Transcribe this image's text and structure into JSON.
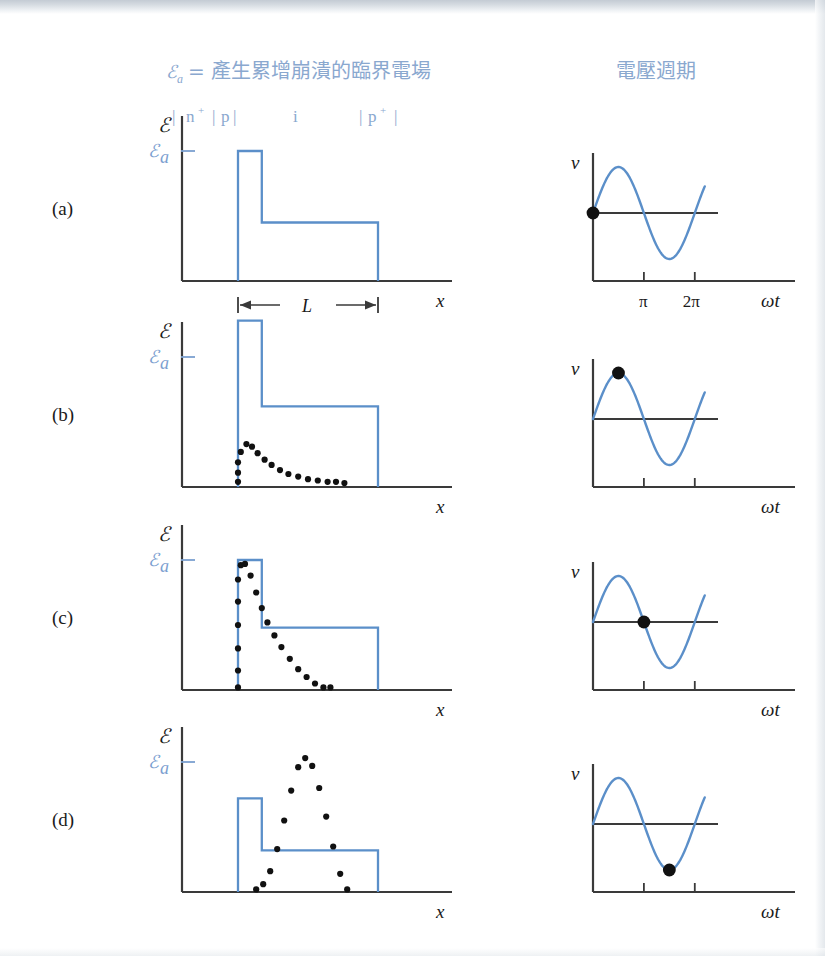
{
  "figure": {
    "headers": {
      "left_legend": "ℰa = 產生累增崩潰的臨界電場",
      "left_legend_symbol": "ℰ",
      "left_legend_sub": "a",
      "left_legend_text": "= 產生累增崩潰的臨界電場",
      "right_title": "電壓週期"
    },
    "layer_labels": [
      {
        "text": "n",
        "sup": "+"
      },
      {
        "text": "p",
        "sup": ""
      },
      {
        "text": "i",
        "sup": ""
      },
      {
        "text": "p",
        "sup": "+"
      }
    ],
    "layer_label_line": "| n+ |p|    i    |p+ |",
    "colors": {
      "curve_blue": "#5b8fc9",
      "label_blue": "#7ba0d0",
      "header_blue": "#8aa8cf",
      "axis_black": "#3a3a3a",
      "dot_black": "#111111",
      "background": "#ffffff"
    },
    "axis_labels": {
      "field_y": "ℰ",
      "field_x": "x",
      "voltage_y": "v",
      "voltage_x": "ωt",
      "critical_field": "ℰa",
      "critical_field_symbol": "ℰ",
      "critical_field_sub": "a",
      "length_label": "L",
      "tick_pi": "π",
      "tick_2pi": "2π"
    },
    "panels": [
      {
        "id": "a",
        "label": "(a)",
        "field": {
          "step_top_relative_to_Ea": "equal",
          "step_peak": 1.0,
          "plateau": 0.45,
          "has_dotted_curve": false,
          "dotted_curve_type": "none",
          "show_length_dimension": true,
          "show_axis_tick": true
        },
        "voltage": {
          "marker_phase": "0",
          "marker_phase_value": 0.0,
          "marker_label": "start of cycle",
          "show_tick_labels": true
        }
      },
      {
        "id": "b",
        "label": "(b)",
        "field": {
          "step_top_relative_to_Ea": "above",
          "step_peak": 1.28,
          "plateau": 0.62,
          "has_dotted_curve": true,
          "dotted_curve_type": "decaying",
          "dotted_peak": 0.33,
          "show_length_dimension": false,
          "show_axis_tick": true
        },
        "voltage": {
          "marker_phase": "π/2",
          "marker_phase_value": 1.5708,
          "marker_label": "peak of cycle",
          "show_tick_labels": false
        }
      },
      {
        "id": "c",
        "label": "(c)",
        "field": {
          "step_top_relative_to_Ea": "equal",
          "step_peak": 1.0,
          "plateau": 0.48,
          "has_dotted_curve": true,
          "dotted_curve_type": "rise-and-decay",
          "dotted_peak": 0.97,
          "show_length_dimension": false,
          "show_axis_tick": true
        },
        "voltage": {
          "marker_phase": "π",
          "marker_phase_value": 3.1416,
          "marker_label": "zero crossing",
          "show_tick_labels": false
        }
      },
      {
        "id": "d",
        "label": "(d)",
        "field": {
          "step_top_relative_to_Ea": "below",
          "step_peak": 0.72,
          "plateau": 0.32,
          "has_dotted_curve": true,
          "dotted_curve_type": "travelling-bell",
          "dotted_peak": 1.03,
          "show_length_dimension": false,
          "show_axis_tick": true
        },
        "voltage": {
          "marker_phase": "3π/2",
          "marker_phase_value": 4.7124,
          "marker_label": "trough of cycle",
          "show_tick_labels": false
        }
      }
    ]
  },
  "chart_data": {
    "type": "line",
    "subtitle": "ℰa = 產生累增崩潰的臨界電場 | 電壓週期",
    "panel_count": 4,
    "left_column": {
      "xlabel": "x",
      "ylabel": "ℰ",
      "reference_line": "ℰa",
      "device_layers": [
        "n+",
        "p",
        "i",
        "p+"
      ],
      "length_annotation": "L",
      "series": [
        {
          "name": "field-profile-a",
          "panel": "a",
          "type": "step",
          "x": [
            0.0,
            0.0,
            0.17,
            0.17,
            1.0,
            1.0
          ],
          "y": [
            0.0,
            1.0,
            1.0,
            0.45,
            0.45,
            0.0
          ]
        },
        {
          "name": "field-profile-b",
          "panel": "b",
          "type": "step",
          "x": [
            0.0,
            0.0,
            0.17,
            0.17,
            1.0,
            1.0
          ],
          "y": [
            0.0,
            1.28,
            1.28,
            0.62,
            0.62,
            0.0
          ]
        },
        {
          "name": "carrier-density-b",
          "panel": "b",
          "type": "dotted",
          "x": [
            0.0,
            0.0,
            0.0,
            0.02,
            0.06,
            0.1,
            0.14,
            0.19,
            0.24,
            0.3,
            0.36,
            0.43,
            0.5,
            0.57,
            0.64,
            0.7,
            0.76
          ],
          "y": [
            0.04,
            0.11,
            0.19,
            0.27,
            0.33,
            0.31,
            0.26,
            0.21,
            0.17,
            0.13,
            0.1,
            0.08,
            0.06,
            0.05,
            0.04,
            0.04,
            0.03
          ]
        },
        {
          "name": "field-profile-c",
          "panel": "c",
          "type": "step",
          "x": [
            0.0,
            0.0,
            0.17,
            0.17,
            1.0,
            1.0
          ],
          "y": [
            0.0,
            1.0,
            1.0,
            0.48,
            0.48,
            0.0
          ]
        },
        {
          "name": "carrier-density-c",
          "panel": "c",
          "type": "dotted",
          "x": [
            0.0,
            0.0,
            0.0,
            0.0,
            0.0,
            0.0,
            0.02,
            0.05,
            0.09,
            0.13,
            0.17,
            0.21,
            0.26,
            0.31,
            0.37,
            0.43,
            0.49,
            0.55,
            0.61,
            0.66
          ],
          "y": [
            0.02,
            0.15,
            0.32,
            0.5,
            0.68,
            0.85,
            0.96,
            0.97,
            0.88,
            0.75,
            0.63,
            0.52,
            0.42,
            0.33,
            0.24,
            0.16,
            0.1,
            0.05,
            0.02,
            0.02
          ]
        },
        {
          "name": "field-profile-d",
          "panel": "d",
          "type": "step",
          "x": [
            0.0,
            0.0,
            0.17,
            0.17,
            1.0,
            1.0
          ],
          "y": [
            0.0,
            0.72,
            0.72,
            0.32,
            0.32,
            0.0
          ]
        },
        {
          "name": "carrier-density-d",
          "panel": "d",
          "type": "dotted",
          "x": [
            0.13,
            0.18,
            0.23,
            0.28,
            0.33,
            0.38,
            0.43,
            0.48,
            0.53,
            0.58,
            0.63,
            0.68,
            0.73,
            0.78
          ],
          "y": [
            0.02,
            0.06,
            0.16,
            0.33,
            0.55,
            0.78,
            0.96,
            1.03,
            0.97,
            0.8,
            0.58,
            0.35,
            0.14,
            0.02
          ]
        }
      ]
    },
    "right_column": {
      "xlabel": "ωt",
      "ylabel": "v",
      "xticks": [
        3.1416,
        6.2832
      ],
      "xticklabels": [
        "π",
        "2π"
      ],
      "function": "v = sin(ωt)",
      "amplitude": 1.0,
      "xlim": [
        0,
        7.2
      ],
      "marker_phases": [
        0.0,
        1.5708,
        3.1416,
        4.7124
      ],
      "marker_panel_ids": [
        "a",
        "b",
        "c",
        "d"
      ]
    }
  }
}
